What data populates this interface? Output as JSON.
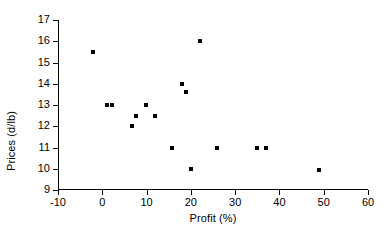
{
  "chart_data": {
    "type": "scatter",
    "title": "",
    "xlabel": "Profit (%)",
    "ylabel": "Prices (d/lb)",
    "xlim": [
      -10,
      60
    ],
    "ylim": [
      9,
      17
    ],
    "xticks": [
      "-10",
      "0",
      "10",
      "20",
      "30",
      "40",
      "50",
      "60"
    ],
    "xtick_values": [
      -10,
      0,
      10,
      20,
      30,
      40,
      50,
      60
    ],
    "yticks": [
      "9",
      "10",
      "11",
      "12",
      "13",
      "14",
      "15",
      "16",
      "17"
    ],
    "ytick_values": [
      9,
      10,
      11,
      12,
      13,
      14,
      15,
      16,
      17
    ],
    "grid": false,
    "legend": false,
    "marker": "square",
    "marker_color": "#000000",
    "points": [
      {
        "x": -2.0,
        "y": 15.5
      },
      {
        "x": 1.0,
        "y": 13.0
      },
      {
        "x": 2.2,
        "y": 13.0
      },
      {
        "x": 6.8,
        "y": 12.0
      },
      {
        "x": 7.7,
        "y": 12.5
      },
      {
        "x": 9.8,
        "y": 13.0
      },
      {
        "x": 11.8,
        "y": 12.5
      },
      {
        "x": 15.8,
        "y": 11.0
      },
      {
        "x": 17.9,
        "y": 14.0
      },
      {
        "x": 19.0,
        "y": 13.6
      },
      {
        "x": 20.0,
        "y": 10.0
      },
      {
        "x": 22.0,
        "y": 16.0
      },
      {
        "x": 26.0,
        "y": 11.0
      },
      {
        "x": 35.0,
        "y": 11.0
      },
      {
        "x": 37.0,
        "y": 11.0
      },
      {
        "x": 49.0,
        "y": 9.95
      }
    ]
  }
}
